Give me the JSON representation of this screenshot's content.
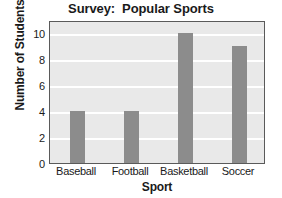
{
  "chart_data": {
    "type": "bar",
    "title": "Survey:  Popular Sports",
    "xlabel": "Sport",
    "ylabel": "Number of Students",
    "categories": [
      "Baseball",
      "Football",
      "Basketball",
      "Soccer"
    ],
    "values": [
      4,
      4,
      10,
      9
    ],
    "ylim": [
      0,
      11
    ],
    "yticks": [
      0,
      2,
      4,
      6,
      8,
      10
    ],
    "ytick_labels": [
      "0",
      "2",
      "4",
      "6",
      "8",
      "10"
    ],
    "grid": "horizontal-white",
    "legend": "none",
    "colors": {
      "bar": "#8c8c8c",
      "plot_background": "#e9e9e9",
      "gridline": "#ffffff",
      "axis_border": "#5a5a5a",
      "figure_background": "#ffffff",
      "text": "#1a1a1a"
    }
  }
}
